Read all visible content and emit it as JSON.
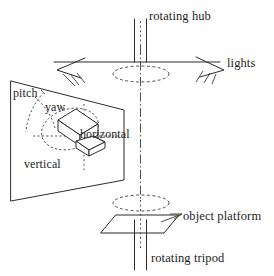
{
  "figure": {
    "background_color": "#ffffff",
    "line_color": "#2b2b2b",
    "text_color": "#1d1d1d"
  },
  "labels": {
    "rotating_hub": "rotating hub",
    "lights": "lights",
    "pitch": "pitch",
    "yaw": "yaw",
    "horizontal": "horizontal",
    "vertical": "vertical",
    "object_platform": "object platform",
    "rotating_tripod": "rotating tripod"
  },
  "components": {
    "hub_shaft": "vertical twin-line shaft at top",
    "hub_arm": "horizontal boom supporting two lights",
    "hub_ellipse": "dashed rotation ellipse under hub",
    "light_left": "left lamp with three emitted rays",
    "light_right": "right lamp with three emitted rays",
    "camera_panel": "quadrilateral panel containing camera pose axes",
    "camera_body": "3D box representing camera",
    "camera_lens": "wedge-shaped lens pointing right-down",
    "pitch_arc": "dashed arc for pitch rotation",
    "yaw_arc": "dashed ellipse for yaw rotation",
    "horizontal_axis": "dashed horizontal translation axis",
    "vertical_axis": "dotted vertical translation axis",
    "platform_ellipse": "dashed rotation ellipse above object platform",
    "platform_surface": "parallelogram object platform",
    "tripod_post": "twin-line vertical post below platform",
    "center_axis": "dash-dot vertical centerline through whole rig"
  },
  "icons": {
    "lamp": "lamp-icon",
    "rays": "light-rays-icon",
    "rotation": "rotation-ellipse-icon"
  }
}
